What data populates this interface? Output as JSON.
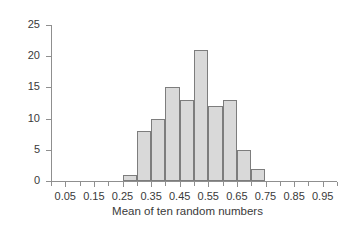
{
  "chart_data": {
    "type": "bar",
    "title": "",
    "subtitle": "",
    "xlabel": "Mean of ten random numbers",
    "ylabel": "Frequency",
    "categories": [
      "0.25-0.30",
      "0.30-0.35",
      "0.35-0.40",
      "0.40-0.45",
      "0.45-0.50",
      "0.50-0.55",
      "0.55-0.60",
      "0.60-0.65",
      "0.65-0.70",
      "0.70-0.75"
    ],
    "bin_edges": [
      0.25,
      0.3,
      0.35,
      0.4,
      0.45,
      0.5,
      0.55,
      0.6,
      0.65,
      0.7,
      0.75
    ],
    "bin_starts": [
      0.25,
      0.3,
      0.35,
      0.4,
      0.45,
      0.5,
      0.55,
      0.6,
      0.65,
      0.7
    ],
    "bin_width": 0.05,
    "values": [
      1,
      8,
      10,
      15,
      13,
      21,
      12,
      13,
      5,
      2
    ],
    "xlim": [
      0.0,
      1.0
    ],
    "ylim": [
      0,
      25
    ],
    "xticks": [
      0.05,
      0.15,
      0.25,
      0.35,
      0.45,
      0.55,
      0.65,
      0.75,
      0.85,
      0.95
    ],
    "xticklabels": [
      "0.05",
      "0.15",
      "0.25",
      "0.35",
      "0.45",
      "0.55",
      "0.65",
      "0.75",
      "0.85",
      "0.95"
    ],
    "xminorticks": [
      0.0,
      0.1,
      0.2,
      0.3,
      0.4,
      0.5,
      0.6,
      0.7,
      0.8,
      0.9,
      1.0
    ],
    "yticks": [
      0,
      5,
      10,
      15,
      20,
      25
    ],
    "yticklabels": [
      "0",
      "5",
      "10",
      "15",
      "20",
      "25"
    ],
    "grid": false,
    "legend": null,
    "bar_fill_color": "#d9d9d9",
    "bar_edge_color": "#7d7d7d",
    "axis_color": "#8f8f8f",
    "text_color": "#3a3a3a",
    "background_color": "#ffffff",
    "annotations": []
  },
  "caption": {
    "partial_text": ""
  }
}
